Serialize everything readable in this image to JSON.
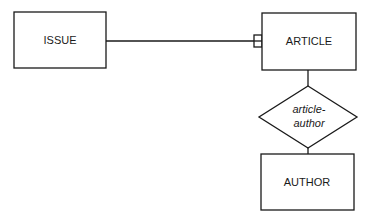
{
  "diagram": {
    "type": "entity-relationship",
    "entities": [
      {
        "id": "issue",
        "label": "ISSUE"
      },
      {
        "id": "article",
        "label": "ARTICLE"
      },
      {
        "id": "author",
        "label": "AUTHOR"
      }
    ],
    "relationships": [
      {
        "id": "article-author",
        "label_line1": "article-",
        "label_line2": "author"
      }
    ],
    "edges": [
      {
        "from": "issue",
        "to": "article",
        "end_marker": "many-connector"
      },
      {
        "from": "article",
        "to": "article-author"
      },
      {
        "from": "article-author",
        "to": "author"
      }
    ],
    "colors": {
      "stroke": "#1a1a1a",
      "background": "#ffffff"
    }
  }
}
